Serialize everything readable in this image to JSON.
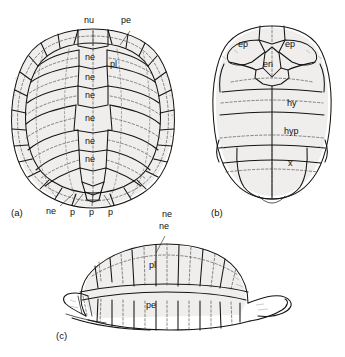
{
  "figure": {
    "style": "ink line drawing, black on white"
  },
  "panels": [
    {
      "id": "a",
      "letter": "(a)",
      "view": "carapace-dorsal",
      "labels": [
        {
          "id": "nu",
          "text": "nu",
          "x": 87,
          "y": 22,
          "leader": true,
          "lx1": 93,
          "ly1": 31,
          "lx2": 93,
          "ly2": 44
        },
        {
          "id": "pe",
          "text": "pe",
          "x": 124,
          "y": 22,
          "leader": true,
          "lx1": 130,
          "ly1": 31,
          "lx2": 120,
          "ly2": 44
        },
        {
          "id": "ne1",
          "text": "ne",
          "x": 85,
          "y": 57,
          "leader": false
        },
        {
          "id": "pl",
          "text": "pl",
          "x": 110,
          "y": 64,
          "leader": false
        },
        {
          "id": "ne2",
          "text": "ne",
          "x": 85,
          "y": 77,
          "leader": false
        },
        {
          "id": "ne3",
          "text": "ne",
          "x": 85,
          "y": 95,
          "leader": false
        },
        {
          "id": "ne4",
          "text": "ne",
          "x": 85,
          "y": 118,
          "leader": false
        },
        {
          "id": "ne5",
          "text": "ne",
          "x": 85,
          "y": 141,
          "leader": false
        },
        {
          "id": "ne6",
          "text": "ne",
          "x": 85,
          "y": 158,
          "leader": false
        },
        {
          "id": "ne7",
          "text": "ne",
          "x": 48,
          "y": 210,
          "leader": true,
          "lx1": 60,
          "ly1": 208,
          "lx2": 72,
          "ly2": 196
        },
        {
          "id": "p1",
          "text": "p",
          "x": 70,
          "y": 213,
          "leader": true,
          "lx1": 73,
          "ly1": 208,
          "lx2": 82,
          "ly2": 195
        },
        {
          "id": "p2",
          "text": "p",
          "x": 89,
          "y": 213,
          "leader": true,
          "lx1": 92,
          "ly1": 208,
          "lx2": 93,
          "ly2": 193
        },
        {
          "id": "p3",
          "text": "p",
          "x": 108,
          "y": 213,
          "leader": true,
          "lx1": 110,
          "ly1": 208,
          "lx2": 104,
          "ly2": 196
        },
        {
          "id": "ne8",
          "text": "ne",
          "x": 163,
          "y": 213,
          "leader": false
        }
      ]
    },
    {
      "id": "b",
      "letter": "(b)",
      "view": "plastron-ventral",
      "labels": [
        {
          "id": "ep_left",
          "text": "ep",
          "x": 240,
          "y": 44
        },
        {
          "id": "ep_right",
          "text": "ep",
          "x": 286,
          "y": 44
        },
        {
          "id": "en",
          "text": "en",
          "x": 264,
          "y": 64
        },
        {
          "id": "hy",
          "text": "hy",
          "x": 288,
          "y": 103
        },
        {
          "id": "hyp",
          "text": "hyp",
          "x": 286,
          "y": 131
        },
        {
          "id": "x",
          "text": "x",
          "x": 288,
          "y": 163
        }
      ]
    },
    {
      "id": "c",
      "letter": "(c)",
      "view": "lateral",
      "labels": [
        {
          "id": "ne_c",
          "text": "ne",
          "x": 160,
          "y": 227,
          "leader": true,
          "lx1": 165,
          "ly1": 235,
          "lx2": 157,
          "ly2": 253
        },
        {
          "id": "pl_c",
          "text": "pl",
          "x": 150,
          "y": 265,
          "leader": false
        },
        {
          "id": "pe_c",
          "text": "pe",
          "x": 147,
          "y": 305,
          "leader": false
        }
      ]
    }
  ],
  "panel_letters": [
    {
      "id": "a",
      "text": "(a)",
      "x": 11,
      "y": 213
    },
    {
      "id": "b",
      "text": "(b)",
      "x": 211,
      "y": 213
    },
    {
      "id": "c",
      "text": "(c)",
      "x": 56,
      "y": 335
    }
  ],
  "abbreviations": {
    "nu": "nuchal",
    "ne": "neural",
    "pl": "pleural",
    "pe": "peripheral",
    "p": "pygal",
    "ep": "epiplastron",
    "en": "entoplastron",
    "hy": "hyoplastron",
    "hyp": "hypoplastron",
    "x": "xiphiplastron"
  },
  "colors": {
    "ink": "#141414",
    "dashed": "#4a4a4a",
    "shade": "#e6e4e1",
    "background": "#ffffff"
  }
}
